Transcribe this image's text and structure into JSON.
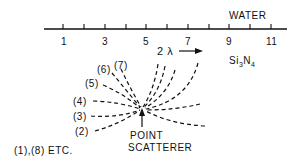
{
  "medium_label": "WATER",
  "substrate": {
    "base": "Si",
    "sub1": "3",
    "mid": "N",
    "sub2": "4"
  },
  "axis": {
    "tick_labels": [
      "1",
      "3",
      "5",
      "7",
      "9",
      "11"
    ],
    "tick_count": 11
  },
  "wavelength_label": "2 λ",
  "order_labels": [
    "(2)",
    "(3)",
    "(4)",
    "(5)",
    "(6)",
    "(7)"
  ],
  "scatterer_label_line1": "POINT",
  "scatterer_label_line2": "SCATTERER",
  "footnote": "(1),(8) ETC."
}
